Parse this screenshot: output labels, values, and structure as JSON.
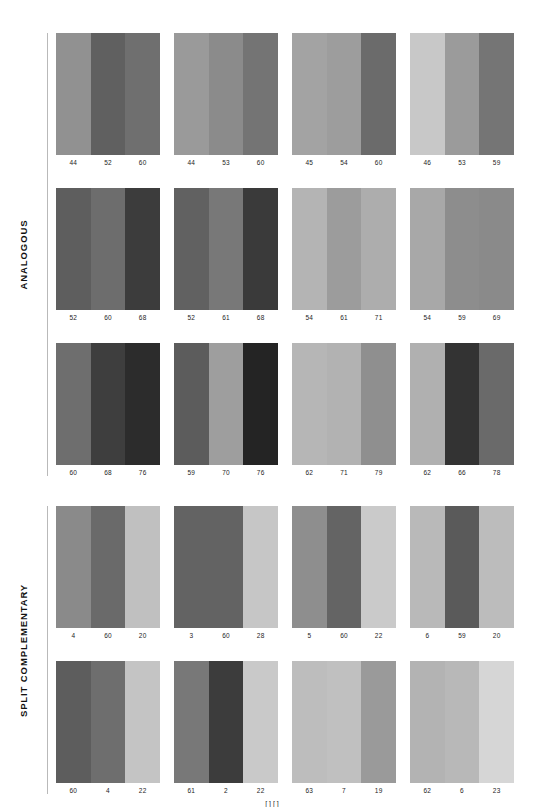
{
  "sections": [
    {
      "label": "ANALOGOUS",
      "rows": [
        {
          "blocks": [
            {
              "swatches": [
                {
                  "value": "44",
                  "color": "#919191"
                },
                {
                  "value": "52",
                  "color": "#606060"
                },
                {
                  "value": "60",
                  "color": "#6f6f6f"
                }
              ]
            },
            {
              "swatches": [
                {
                  "value": "44",
                  "color": "#9a9a9a"
                },
                {
                  "value": "53",
                  "color": "#8b8b8b"
                },
                {
                  "value": "60",
                  "color": "#747474"
                }
              ]
            },
            {
              "swatches": [
                {
                  "value": "45",
                  "color": "#a3a3a3"
                },
                {
                  "value": "54",
                  "color": "#9d9d9d"
                },
                {
                  "value": "60",
                  "color": "#6b6b6b"
                }
              ]
            },
            {
              "swatches": [
                {
                  "value": "46",
                  "color": "#c8c8c8"
                },
                {
                  "value": "53",
                  "color": "#9b9b9b"
                },
                {
                  "value": "59",
                  "color": "#757575"
                }
              ]
            }
          ]
        },
        {
          "blocks": [
            {
              "swatches": [
                {
                  "value": "52",
                  "color": "#5e5e5e"
                },
                {
                  "value": "60",
                  "color": "#6d6d6d"
                },
                {
                  "value": "68",
                  "color": "#3c3c3c"
                }
              ]
            },
            {
              "swatches": [
                {
                  "value": "52",
                  "color": "#616161"
                },
                {
                  "value": "61",
                  "color": "#787878"
                },
                {
                  "value": "68",
                  "color": "#3a3a3a"
                }
              ]
            },
            {
              "swatches": [
                {
                  "value": "54",
                  "color": "#b4b4b4"
                },
                {
                  "value": "61",
                  "color": "#9c9c9c"
                },
                {
                  "value": "71",
                  "color": "#adadad"
                }
              ]
            },
            {
              "swatches": [
                {
                  "value": "54",
                  "color": "#a8a8a8"
                },
                {
                  "value": "59",
                  "color": "#8d8d8d"
                },
                {
                  "value": "69",
                  "color": "#8a8a8a"
                }
              ]
            }
          ]
        },
        {
          "blocks": [
            {
              "swatches": [
                {
                  "value": "60",
                  "color": "#6e6e6e"
                },
                {
                  "value": "68",
                  "color": "#3e3e3e"
                },
                {
                  "value": "76",
                  "color": "#2c2c2c"
                }
              ]
            },
            {
              "swatches": [
                {
                  "value": "59",
                  "color": "#5c5c5c"
                },
                {
                  "value": "70",
                  "color": "#9e9e9e"
                },
                {
                  "value": "76",
                  "color": "#242424"
                }
              ]
            },
            {
              "swatches": [
                {
                  "value": "62",
                  "color": "#b6b6b6"
                },
                {
                  "value": "71",
                  "color": "#b2b2b2"
                },
                {
                  "value": "79",
                  "color": "#8f8f8f"
                }
              ]
            },
            {
              "swatches": [
                {
                  "value": "62",
                  "color": "#b0b0b0"
                },
                {
                  "value": "66",
                  "color": "#333333"
                },
                {
                  "value": "78",
                  "color": "#6a6a6a"
                }
              ]
            }
          ]
        }
      ]
    },
    {
      "label": "SPLIT COMPLEMENTARY",
      "rows": [
        {
          "blocks": [
            {
              "swatches": [
                {
                  "value": "4",
                  "color": "#8a8a8a"
                },
                {
                  "value": "60",
                  "color": "#6a6a6a"
                },
                {
                  "value": "20",
                  "color": "#c0c0c0"
                }
              ]
            },
            {
              "swatches": [
                {
                  "value": "3",
                  "color": "#636363"
                },
                {
                  "value": "60",
                  "color": "#636363"
                },
                {
                  "value": "28",
                  "color": "#c6c6c6"
                }
              ]
            },
            {
              "swatches": [
                {
                  "value": "5",
                  "color": "#8e8e8e"
                },
                {
                  "value": "60",
                  "color": "#646464"
                },
                {
                  "value": "22",
                  "color": "#cacaca"
                }
              ]
            },
            {
              "swatches": [
                {
                  "value": "6",
                  "color": "#b9b9b9"
                },
                {
                  "value": "59",
                  "color": "#5a5a5a"
                },
                {
                  "value": "20",
                  "color": "#bcbcbc"
                }
              ]
            }
          ]
        },
        {
          "blocks": [
            {
              "swatches": [
                {
                  "value": "60",
                  "color": "#5d5d5d"
                },
                {
                  "value": "4",
                  "color": "#6e6e6e"
                },
                {
                  "value": "22",
                  "color": "#c4c4c4"
                }
              ]
            },
            {
              "swatches": [
                {
                  "value": "61",
                  "color": "#787878"
                },
                {
                  "value": "2",
                  "color": "#3c3c3c"
                },
                {
                  "value": "22",
                  "color": "#c9c9c9"
                }
              ]
            },
            {
              "swatches": [
                {
                  "value": "63",
                  "color": "#bdbdbd"
                },
                {
                  "value": "7",
                  "color": "#c0c0c0"
                },
                {
                  "value": "19",
                  "color": "#9a9a9a"
                }
              ]
            },
            {
              "swatches": [
                {
                  "value": "62",
                  "color": "#b3b3b3"
                },
                {
                  "value": "6",
                  "color": "#b8b8b8"
                },
                {
                  "value": "23",
                  "color": "#d6d6d6"
                }
              ]
            }
          ]
        }
      ]
    }
  ],
  "footer": {
    "mark": "[ ] [ ]"
  }
}
